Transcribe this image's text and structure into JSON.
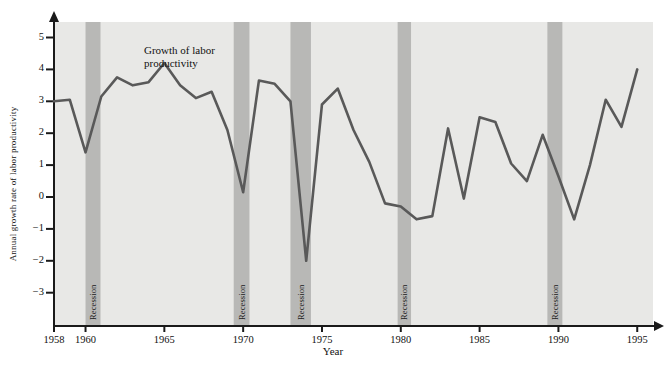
{
  "chart_data": {
    "type": "line",
    "title": "",
    "annotation": "Growth of labor\nproductivity",
    "annotation_line1": "Growth of labor",
    "annotation_line2": "productivity",
    "xlabel": "Year",
    "ylabel": "Annual growth rate of labor productivity",
    "xlim": [
      1958,
      1996
    ],
    "ylim": [
      -3.4,
      5.6
    ],
    "xticks": [
      1958,
      1960,
      1965,
      1970,
      1975,
      1980,
      1985,
      1990,
      1995
    ],
    "xtick_labels": [
      "1958",
      "1960",
      "1965",
      "1970",
      "1975",
      "1980",
      "1985",
      "1990",
      "1995"
    ],
    "yticks": [
      -3,
      -2,
      -1,
      0,
      1,
      2,
      3,
      4,
      5
    ],
    "ytick_labels": [
      "-3",
      "-2",
      "-1",
      "0",
      "1",
      "2",
      "3",
      "4",
      "5"
    ],
    "grid": false,
    "legend": "none",
    "line_color": "#595959",
    "plot_bg_color": "#e8e8e6",
    "recession_band_color": "#b8b8b6",
    "axis_color": "#1a1a1a",
    "series": [
      {
        "name": "Growth of labor productivity",
        "x": [
          1958,
          1959,
          1960,
          1961,
          1962,
          1963,
          1964,
          1965,
          1966,
          1967,
          1968,
          1969,
          1970,
          1971,
          1972,
          1973,
          1974,
          1975,
          1976,
          1977,
          1978,
          1979,
          1980,
          1981,
          1982,
          1983,
          1984,
          1985,
          1986,
          1987,
          1988,
          1989,
          1990,
          1991,
          1992,
          1993,
          1994,
          1995
        ],
        "values": [
          3.0,
          3.05,
          1.4,
          3.15,
          3.75,
          3.5,
          3.6,
          4.2,
          3.5,
          3.1,
          3.3,
          2.1,
          0.15,
          3.65,
          3.55,
          3.0,
          -2.0,
          2.9,
          3.4,
          2.1,
          1.1,
          -0.2,
          -0.3,
          -0.7,
          -0.6,
          2.15,
          -0.05,
          2.5,
          2.35,
          1.05,
          0.5,
          1.95,
          0.65,
          -0.7,
          1.0,
          3.05,
          2.2,
          4.0
        ]
      }
    ],
    "recessions": [
      {
        "label": "Recession",
        "start": 1960.0,
        "end": 1960.95
      },
      {
        "label": "Recession",
        "start": 1969.4,
        "end": 1970.4
      },
      {
        "label": "Recession",
        "start": 1973.0,
        "end": 1974.3
      },
      {
        "label": "Recession",
        "start": 1979.8,
        "end": 1980.65
      },
      {
        "label": "Recession",
        "start": 1989.3,
        "end": 1990.25
      }
    ]
  }
}
